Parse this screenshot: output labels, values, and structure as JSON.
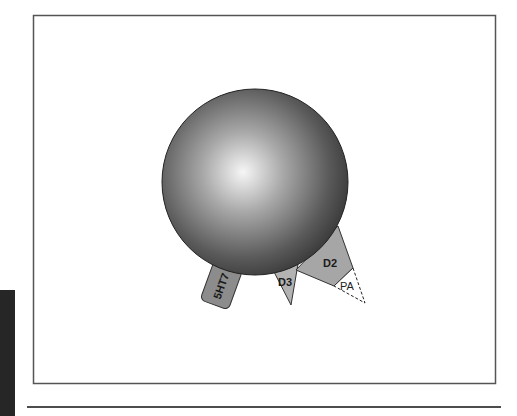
{
  "figure": {
    "sphere": {
      "name": "cell",
      "gradient_light": "#f4f4f4",
      "gradient_dark": "#3a3a3a"
    },
    "receptors": [
      {
        "id": "5HT7",
        "label": "5HT7",
        "shape": "rounded-rect",
        "fill": "#8c8c8c"
      },
      {
        "id": "D3",
        "label": "D3",
        "shape": "triangle",
        "fill": "#b3b3b3"
      },
      {
        "id": "D2",
        "label": "D2",
        "shape": "triangle",
        "fill": "#a6a6a6"
      },
      {
        "id": "PA",
        "label": "PA",
        "shape": "dashed-triangle",
        "fill": "#ffffff"
      }
    ],
    "colors": {
      "frame": "#555555",
      "side_block": "#262626",
      "rule": "#4d4d4d"
    }
  }
}
